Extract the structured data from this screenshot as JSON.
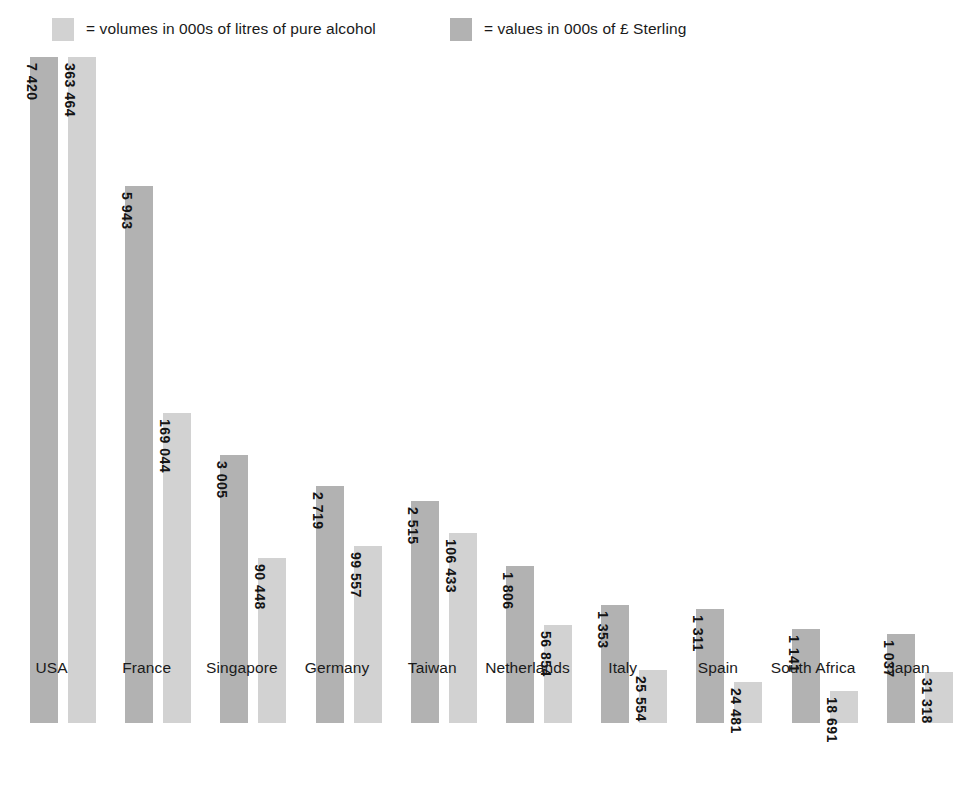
{
  "legend": {
    "entries": [
      {
        "label": "= volumes in 000s of litres of pure alcohol",
        "color": "#d2d2d2",
        "icon": "legend-swatch-light"
      },
      {
        "label": "= values in 000s of £ Sterling",
        "color": "#b2b2b2",
        "icon": "legend-swatch-dark"
      }
    ]
  },
  "chart_data": {
    "type": "bar",
    "title": "",
    "xlabel": "",
    "ylabel": "",
    "grid": false,
    "legend_position": "top",
    "categories": [
      "USA",
      "France",
      "Singapore",
      "Germany",
      "Taiwan",
      "Netherlands",
      "Italy",
      "Spain",
      "South Africa",
      "Japan"
    ],
    "series": [
      {
        "name": "= values in 000s of £ Sterling",
        "unit": "000s of £ Sterling",
        "color": "#b2b2b2",
        "values": [
          7420,
          5943,
          3005,
          2719,
          2515,
          1806,
          1353,
          1311,
          1141,
          1037
        ],
        "labels": [
          "7 420",
          "5 943",
          "3 005",
          "2 719",
          "2 515",
          "1 806",
          "1 353",
          "1 311",
          "1 141",
          "1 037"
        ]
      },
      {
        "name": "= volumes in 000s of litres of pure alcohol",
        "unit": "000s of litres of pure alcohol",
        "color": "#d2d2d2",
        "values": [
          363464,
          169044,
          90448,
          99557,
          106433,
          56854,
          25554,
          24481,
          18691,
          31318
        ],
        "labels": [
          "363 464",
          "169 044",
          "90 448",
          "99 557",
          "106 433",
          "56 854",
          "25 554",
          "24 481",
          "18 691",
          "31 318"
        ]
      }
    ],
    "bar_pixel_heights": {
      "volumes_series_dark": [
        666,
        537,
        268,
        237,
        222,
        157,
        118,
        114,
        94,
        89
      ],
      "values_series_light": [
        666,
        310,
        165,
        177,
        190,
        98,
        53,
        41,
        32,
        51
      ]
    }
  }
}
